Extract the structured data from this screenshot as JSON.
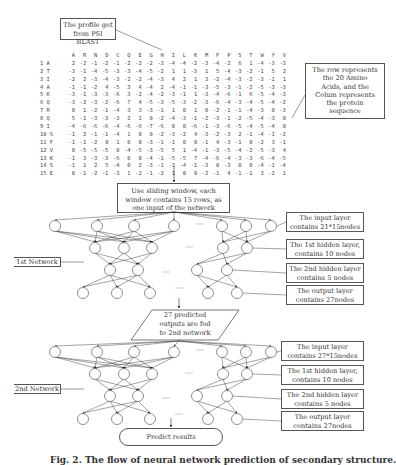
{
  "profile_box": {
    "line1": "The profile get",
    "line2": "from PSI BLAST"
  },
  "row_note_box": {
    "lines": [
      "The row represents",
      "the 20 Amino",
      "Acids, and the",
      "Colum represents",
      "the protein",
      "sequence"
    ]
  },
  "matrix": {
    "columns": [
      "A",
      "R",
      "N",
      "D",
      "C",
      "Q",
      "E",
      "G",
      "H",
      "I",
      "L",
      "K",
      "M",
      "F",
      "P",
      "S",
      "T",
      "W",
      "Y",
      "V"
    ],
    "rows": [
      {
        "label": "1 A",
        "values": [
          "2",
          "-2",
          "-1",
          "-2",
          "-1",
          "-2",
          "-2",
          "-2",
          "-3",
          "-4",
          "-4",
          "-2",
          "-3",
          "-4",
          "-2",
          "6",
          "1",
          "-4",
          "-3",
          "-3"
        ]
      },
      {
        "label": "2 T",
        "values": [
          "-3",
          "-1",
          "-4",
          "-5",
          "-3",
          "-3",
          "-4",
          "-5",
          "-2",
          "1",
          "1",
          "-3",
          "1",
          "5",
          "-4",
          "-3",
          "-2",
          "-1",
          "5",
          "2"
        ]
      },
      {
        "label": "3 I",
        "values": [
          "-2",
          "2",
          "-3",
          "-4",
          "-3",
          "-2",
          "-2",
          "-4",
          "-3",
          "4",
          "2",
          "1",
          "3",
          "-2",
          "-4",
          "-3",
          "-2",
          "-3",
          "-1",
          "1"
        ]
      },
      {
        "label": "4 A",
        "values": [
          "-1",
          "-1",
          "-2",
          "4",
          "-5",
          "3",
          "4",
          "-4",
          "2",
          "-4",
          "-1",
          "-1",
          "-3",
          "-5",
          "-3",
          "-1",
          "-2",
          "-5",
          "-3",
          "-3"
        ]
      },
      {
        "label": "5 K",
        "values": [
          "-3",
          "-1",
          "-3",
          "-3",
          "-6",
          "3",
          "-2",
          "-4",
          "-2",
          "-3",
          "-1",
          "1",
          "-3",
          "-4",
          "-6",
          "-1",
          "6",
          "-5",
          "-4",
          "-3"
        ]
      },
      {
        "label": "6 Q",
        "values": [
          "-3",
          "-2",
          "-3",
          "-2",
          "-6",
          "7",
          "4",
          "-5",
          "-3",
          "-5",
          "-3",
          "-2",
          "-3",
          "-6",
          "-4",
          "-3",
          "-4",
          "-5",
          "-4",
          "-2"
        ]
      },
      {
        "label": "7 R",
        "values": [
          "0",
          "1",
          "-2",
          "-1",
          "-4",
          "3",
          "3",
          "-3",
          "-1",
          "1",
          "0",
          "1",
          "0",
          "-2",
          "-1",
          "-1",
          "-4",
          "-3",
          "0",
          "-3"
        ]
      },
      {
        "label": "8 Q",
        "values": [
          "5",
          "-1",
          "-3",
          "-3",
          "-3",
          "2",
          "1",
          "0",
          "-2",
          "-4",
          "-3",
          "-1",
          "-2",
          "-3",
          "-1",
          "-2",
          "-5",
          "-4",
          "-3",
          "0"
        ]
      },
      {
        "label": "9 I",
        "values": [
          "-4",
          "-6",
          "-6",
          "-6",
          "-4",
          "-6",
          "-6",
          "-7",
          "-6",
          "0",
          "0",
          "-6",
          "-1",
          "-3",
          "-6",
          "-5",
          "-4",
          "-5",
          "-4",
          "0"
        ]
      },
      {
        "label": "10 S",
        "values": [
          "-1",
          "2",
          "-1",
          "-1",
          "-4",
          "1",
          "0",
          "0",
          "-2",
          "-3",
          "-2",
          "4",
          "-3",
          "-2",
          "-3",
          "2",
          "-1",
          "-4",
          "-1",
          "-2"
        ]
      },
      {
        "label": "11 F",
        "values": [
          "-1",
          "-1",
          "-2",
          "0",
          "1",
          "0",
          "0",
          "-3",
          "-1",
          "-1",
          "0",
          "0",
          "-1",
          "4",
          "-3",
          "-1",
          "0",
          "-2",
          "3",
          "-1"
        ]
      },
      {
        "label": "12 V",
        "values": [
          "0",
          "-5",
          "-5",
          "-5",
          "0",
          "-4",
          "-5",
          "-3",
          "-5",
          "5",
          "1",
          "-4",
          "-1",
          "-3",
          "-5",
          "-4",
          "-2",
          "-5",
          "-3",
          "4"
        ]
      },
      {
        "label": "13 K",
        "values": [
          "-1",
          "3",
          "-3",
          "-3",
          "-6",
          "0",
          "0",
          "-4",
          "-1",
          "-5",
          "-5",
          "7",
          "-4",
          "-6",
          "-4",
          "-3",
          "-3",
          "-6",
          "-4",
          "-5"
        ]
      },
      {
        "label": "14 S",
        "values": [
          "-1",
          "1",
          "2",
          "5",
          "-4",
          "0",
          "2",
          "-3",
          "-1",
          "-3",
          "-4",
          "-1",
          "-3",
          "0",
          "-3",
          "0",
          "0",
          "-4",
          "-1",
          "-4"
        ]
      },
      {
        "label": "15 E",
        "values": [
          "0",
          "-1",
          "-2",
          "-1",
          "-3",
          "1",
          "-2",
          "-1",
          "-2",
          "1",
          "0",
          "0",
          "-2",
          "-1",
          "4",
          "-1",
          "-1",
          "3",
          "-2",
          "1"
        ]
      }
    ]
  },
  "sliding_box": {
    "lines": [
      "Use sliding window, each",
      "window contains 15 rows, as",
      "one input of the network"
    ]
  },
  "network1": {
    "label": "1st Network",
    "annotations": [
      {
        "line1": "The input layer",
        "line2": "contains 21*15nodes"
      },
      {
        "line1": "The 1st hidden layer,",
        "line2": "contains 10 nodes"
      },
      {
        "line1": "The 2nd hidden layer",
        "line2": "contains 5 nodes"
      },
      {
        "line1": "The output layer",
        "line2": "contains 27nodes"
      }
    ]
  },
  "fed_box": {
    "lines": [
      "27 predicted",
      "outputs are fed",
      "to 2nd network"
    ]
  },
  "network2": {
    "label": "2nd Network",
    "annotations": [
      {
        "line1": "The input layer",
        "line2": "contains 27*15nodes"
      },
      {
        "line1": "The 1st hidden layer,",
        "line2": "contains 10 nodes"
      },
      {
        "line1": "The 2nd hidden layer",
        "line2": "contains 5 nodes"
      },
      {
        "line1": "The output layer",
        "line2": "contains 27nodes"
      }
    ]
  },
  "result_box": {
    "label": "Predict results"
  },
  "caption": {
    "text": "Fig. 2. The flow of neural network prediction of secondary structure."
  }
}
